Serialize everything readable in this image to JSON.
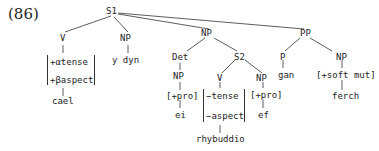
{
  "example_number": "(86)",
  "tree": {
    "root": "S1",
    "nodes": {
      "s1": "S1",
      "v1": "V",
      "v1_feat1": "+αtense",
      "v1_feat2": "+βaspect",
      "v1_word": "cael",
      "np1": "NP",
      "np1_word": "y dyn",
      "np2": "NP",
      "det": "Det",
      "det_np": "NP",
      "det_np_feat": "[+pro]",
      "det_word": "ei",
      "s2": "S2",
      "v2": "V",
      "v2_feat1": "−tense",
      "v2_feat2": "−aspect",
      "v2_word": "rhybuddio",
      "np3": "NP",
      "np3_feat": "[+pro]",
      "np3_word": "ef",
      "pp": "PP",
      "p": "P",
      "p_word": "gan",
      "np4": "NP",
      "np4_feat": "[+soft mut]",
      "np4_word": "ferch"
    }
  }
}
